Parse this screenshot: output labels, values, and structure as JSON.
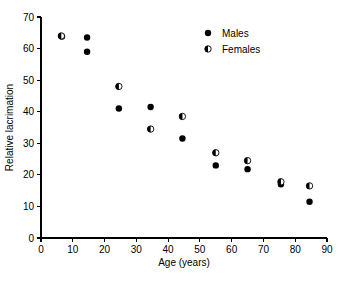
{
  "chart_data": {
    "type": "scatter",
    "title": "",
    "xlabel": "Age (years)",
    "ylabel": "Relative lacrimation",
    "xlim": [
      0,
      90
    ],
    "ylim": [
      0,
      70
    ],
    "xticks": [
      0,
      10,
      20,
      30,
      40,
      50,
      60,
      70,
      80,
      90
    ],
    "yticks": [
      0,
      10,
      20,
      30,
      40,
      50,
      60,
      70
    ],
    "grid": false,
    "legend_position": "top-right",
    "series": [
      {
        "name": "Males",
        "marker": "filled-circle",
        "color": "#000000",
        "points": [
          {
            "x": 6.6,
            "y": 63.8
          },
          {
            "x": 14.5,
            "y": 63.5
          },
          {
            "x": 14.5,
            "y": 59.0
          },
          {
            "x": 24.5,
            "y": 41.0
          },
          {
            "x": 34.5,
            "y": 41.5
          },
          {
            "x": 44.5,
            "y": 31.5
          },
          {
            "x": 55.0,
            "y": 23.0
          },
          {
            "x": 65.0,
            "y": 21.8
          },
          {
            "x": 75.5,
            "y": 17.0
          },
          {
            "x": 84.5,
            "y": 11.5
          }
        ]
      },
      {
        "name": "Females",
        "marker": "half-filled-circle",
        "color": "#000000",
        "points": [
          {
            "x": 6.4,
            "y": 64.0
          },
          {
            "x": 24.5,
            "y": 48.0
          },
          {
            "x": 34.5,
            "y": 34.5
          },
          {
            "x": 44.5,
            "y": 38.5
          },
          {
            "x": 55.0,
            "y": 27.0
          },
          {
            "x": 65.0,
            "y": 24.5
          },
          {
            "x": 75.5,
            "y": 17.8
          },
          {
            "x": 84.5,
            "y": 16.5
          }
        ]
      }
    ]
  },
  "legend": {
    "entries": [
      {
        "label": "Males"
      },
      {
        "label": "Females"
      }
    ]
  },
  "axes": {
    "x_title": "Age (years)",
    "y_title": "Relative lacrimation",
    "x_tick_labels": [
      "0",
      "10",
      "20",
      "30",
      "40",
      "50",
      "60",
      "70",
      "80",
      "90"
    ],
    "y_tick_labels": [
      "0",
      "10",
      "20",
      "30",
      "40",
      "50",
      "60",
      "70"
    ]
  },
  "colors": {
    "foreground": "#000000",
    "background": "#ffffff"
  }
}
